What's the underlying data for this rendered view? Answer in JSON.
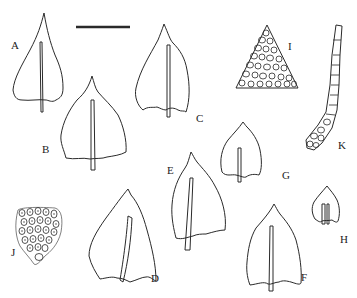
{
  "figure": {
    "type": "botanical plate",
    "scale_bar": {
      "label": ""
    },
    "panels": [
      {
        "id": "A",
        "label": "A",
        "content": "leaf outline with costa"
      },
      {
        "id": "B",
        "label": "B",
        "content": "leaf outline with costa"
      },
      {
        "id": "C",
        "label": "C",
        "content": "leaf outline with costa"
      },
      {
        "id": "D",
        "label": "D",
        "content": "leaf outline with costa"
      },
      {
        "id": "E",
        "label": "E",
        "content": "leaf outline with costa"
      },
      {
        "id": "F",
        "label": "F",
        "content": "leaf outline with costa"
      },
      {
        "id": "G",
        "label": "G",
        "content": "leaf outline with costa (small)"
      },
      {
        "id": "H",
        "label": "H",
        "content": "leaf outline with costa (smallest)"
      },
      {
        "id": "I",
        "label": "I",
        "content": "leaf apex cells"
      },
      {
        "id": "J",
        "label": "J",
        "content": "median leaf cells"
      },
      {
        "id": "K",
        "label": "K",
        "content": "leaf margin cells"
      }
    ]
  },
  "colors": {
    "ink": "#222222",
    "background": "#ffffff"
  }
}
